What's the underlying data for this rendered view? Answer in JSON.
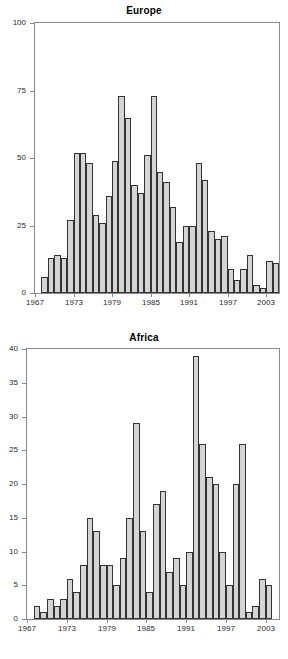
{
  "chart_data": [
    {
      "type": "bar",
      "title": "Europe",
      "xlabel": "",
      "ylabel": "",
      "ylim": [
        0,
        100
      ],
      "yticks": [
        0,
        25,
        50,
        75,
        100
      ],
      "xlim": [
        1967,
        2005
      ],
      "xticks": [
        1967,
        1973,
        1979,
        1985,
        1991,
        1997,
        2003
      ],
      "grid": false,
      "legend": "none",
      "bar_color": "#d4d4d4",
      "bar_edge_color": "#333333",
      "categories": [
        1968,
        1969,
        1970,
        1971,
        1972,
        1973,
        1974,
        1975,
        1976,
        1977,
        1978,
        1979,
        1980,
        1981,
        1982,
        1983,
        1984,
        1985,
        1986,
        1987,
        1988,
        1989,
        1990,
        1991,
        1992,
        1993,
        1994,
        1995,
        1996,
        1997,
        1998,
        1999,
        2000,
        2001,
        2002,
        2003,
        2004
      ],
      "values": [
        6,
        13,
        14,
        13,
        27,
        52,
        52,
        48,
        29,
        26,
        36,
        49,
        73,
        65,
        40,
        37,
        51,
        73,
        45,
        41,
        32,
        19,
        25,
        25,
        48,
        42,
        23,
        20,
        21,
        9,
        5,
        9,
        14,
        3,
        2,
        12,
        11
      ]
    },
    {
      "type": "bar",
      "title": "Africa",
      "xlabel": "",
      "ylabel": "",
      "ylim": [
        0,
        40
      ],
      "yticks": [
        0,
        5,
        10,
        15,
        20,
        25,
        30,
        35,
        40
      ],
      "xlim": [
        1967,
        2005
      ],
      "xticks": [
        1967,
        1973,
        1979,
        1985,
        1991,
        1997,
        2003
      ],
      "grid": false,
      "legend": "none",
      "bar_color": "#d4d4d4",
      "bar_edge_color": "#333333",
      "categories": [
        1968,
        1969,
        1970,
        1971,
        1972,
        1973,
        1974,
        1975,
        1976,
        1977,
        1978,
        1979,
        1980,
        1981,
        1982,
        1983,
        1984,
        1985,
        1986,
        1987,
        1988,
        1989,
        1990,
        1991,
        1992,
        1993,
        1994,
        1995,
        1996,
        1997,
        1998,
        1999,
        2000,
        2001,
        2002,
        2003,
        2004
      ],
      "values": [
        2,
        1,
        3,
        2,
        3,
        6,
        4,
        8,
        15,
        13,
        8,
        8,
        5,
        9,
        15,
        29,
        13,
        4,
        17,
        19,
        7,
        9,
        5,
        10,
        39,
        26,
        21,
        20,
        10,
        5,
        20,
        26,
        1,
        2,
        6,
        5,
        0
      ]
    }
  ],
  "panels": [
    {
      "title": "Europe"
    },
    {
      "title": "Africa"
    }
  ]
}
